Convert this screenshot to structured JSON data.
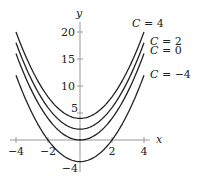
{
  "chart_data": {
    "type": "line",
    "title": "",
    "xlabel": "x",
    "ylabel": "y",
    "xlim": [
      -4,
      4
    ],
    "ylim": [
      -4,
      20
    ],
    "x_ticks": [
      -4,
      -2,
      2,
      4
    ],
    "x_tick_labels": [
      "−4",
      "−2",
      "2",
      "4"
    ],
    "y_ticks": [
      -4,
      5,
      10,
      15,
      20
    ],
    "y_tick_labels": [
      "−4",
      "5",
      "10",
      "15",
      "20"
    ],
    "grid": false,
    "legend": "inline labels at right end of curves",
    "function": "y = x^2 + C",
    "series": [
      {
        "name": "C = 4",
        "C": 4,
        "x": [
          -4,
          -3,
          -2,
          -1,
          0,
          1,
          2,
          3,
          4
        ],
        "values": [
          20,
          13,
          8,
          5,
          4,
          5,
          8,
          13,
          20
        ]
      },
      {
        "name": "C = 2",
        "C": 2,
        "x": [
          -4,
          -3,
          -2,
          -1,
          0,
          1,
          2,
          3,
          4
        ],
        "values": [
          18,
          11,
          6,
          3,
          2,
          3,
          6,
          11,
          18
        ]
      },
      {
        "name": "C = 0",
        "C": 0,
        "x": [
          -4,
          -3,
          -2,
          -1,
          0,
          1,
          2,
          3,
          4
        ],
        "values": [
          16,
          9,
          4,
          1,
          0,
          1,
          4,
          9,
          16
        ]
      },
      {
        "name": "C = −4",
        "C": -4,
        "x": [
          -4,
          -3,
          -2,
          -1,
          0,
          1,
          2,
          3,
          4
        ],
        "values": [
          12,
          5,
          0,
          -3,
          -4,
          -3,
          0,
          5,
          12
        ]
      }
    ]
  },
  "layout": {
    "origin_px": [
      80,
      140
    ],
    "px_per_x": 16,
    "px_per_y": 5.4
  }
}
